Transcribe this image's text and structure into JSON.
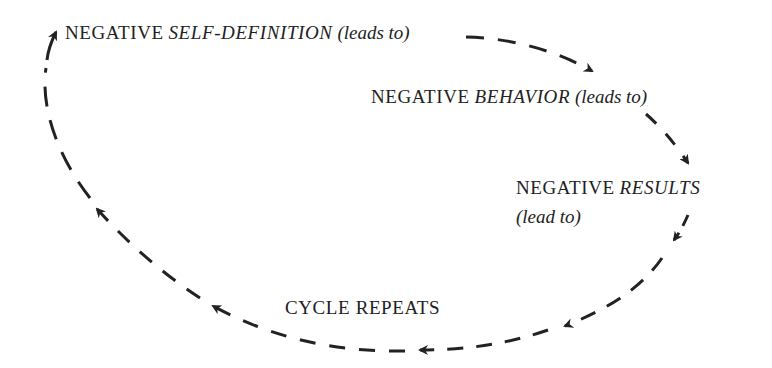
{
  "diagram": {
    "type": "cycle",
    "colors": {
      "text": "#222222",
      "arrow": "#222222",
      "background": "#ffffff"
    },
    "nodes": [
      {
        "id": "self-definition",
        "prefix": "NEGATIVE",
        "emphasis": "SELF-DEFINITION",
        "suffix": "(leads to)"
      },
      {
        "id": "behavior",
        "prefix": "NEGATIVE",
        "emphasis": "BEHAVIOR",
        "suffix": "(leads to)"
      },
      {
        "id": "results",
        "prefix": "NEGATIVE",
        "emphasis": "RESULTS",
        "suffix": "(lead to)"
      },
      {
        "id": "cycle-repeats",
        "label": "CYCLE REPEATS"
      }
    ],
    "edges": [
      {
        "from": "self-definition",
        "to": "behavior",
        "style": "dashed-arrow"
      },
      {
        "from": "behavior",
        "to": "results",
        "style": "dashed-arrow"
      },
      {
        "from": "results",
        "to": "cycle-repeats",
        "style": "dashed-arrow"
      },
      {
        "from": "cycle-repeats",
        "to": "self-definition",
        "style": "dashed-arrow"
      }
    ]
  }
}
